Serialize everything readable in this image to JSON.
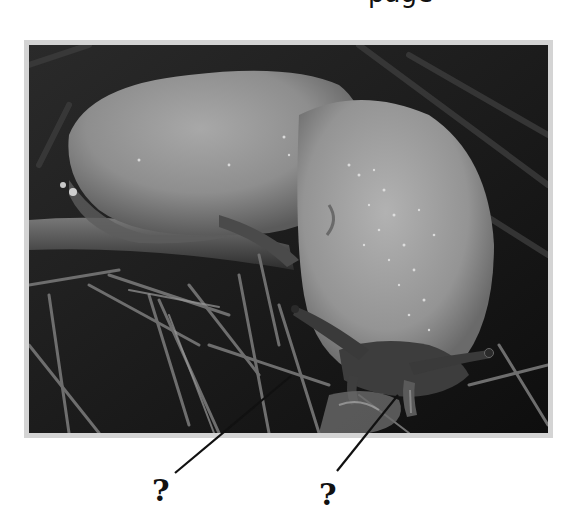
{
  "header": {
    "cut_off_text": "page"
  },
  "figure": {
    "frame_color": "#d4d4d4",
    "labels": [
      {
        "id": "label-1",
        "text": "?",
        "points_to": "lower tentacle (left side)"
      },
      {
        "id": "label-2",
        "text": "?",
        "points_to": "lower tentacle (right side)"
      }
    ]
  }
}
